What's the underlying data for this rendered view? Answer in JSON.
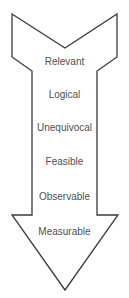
{
  "diagram": {
    "shape": "down-arrow-with-notched-tail",
    "stroke_color": "#3a3a3a",
    "text_color": "#505050",
    "fill_color": "#ffffff",
    "criteria": [
      {
        "label": "Relevant",
        "y": 56
      },
      {
        "label": "Logical",
        "y": 89
      },
      {
        "label": "Unequivocal",
        "y": 122
      },
      {
        "label": "Feasible",
        "y": 156
      },
      {
        "label": "Observable",
        "y": 191
      },
      {
        "label": "Measurable",
        "y": 226
      }
    ]
  }
}
